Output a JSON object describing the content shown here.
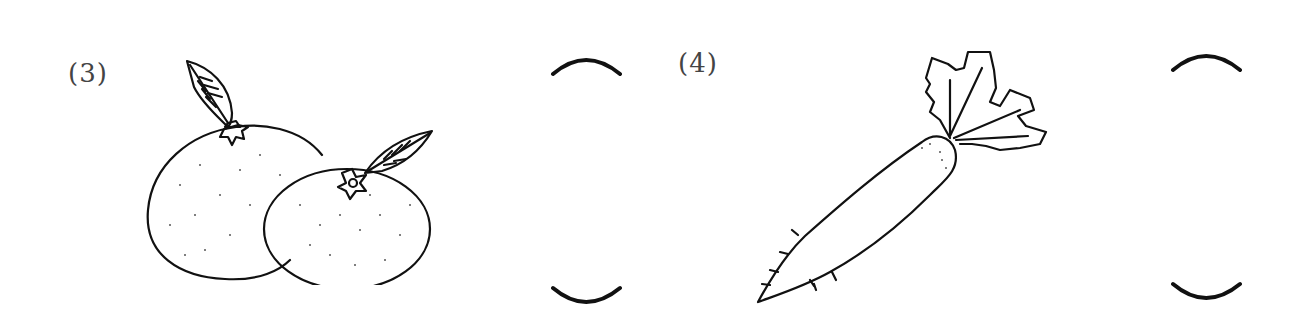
{
  "worksheet": {
    "items": [
      {
        "number_label": "(3)",
        "subject": "mandarin-oranges",
        "answer_blank": ""
      },
      {
        "number_label": "(4)",
        "subject": "daikon-radish",
        "answer_blank": ""
      }
    ]
  },
  "colors": {
    "ink": "#111111",
    "background": "#ffffff"
  }
}
